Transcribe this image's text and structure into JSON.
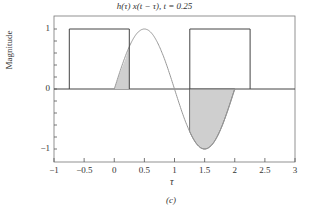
{
  "chart_data": {
    "type": "line",
    "title": "h(τ) x(t − τ), t = 0.25",
    "xlabel": "τ",
    "ylabel": "Magnitude",
    "caption": "(c)",
    "xlim": [
      -1,
      3
    ],
    "ylim": [
      -1.25,
      1.25
    ],
    "xticks": [
      "−1",
      "−0.5",
      "0",
      "0.5",
      "1",
      "1.5",
      "2",
      "2.5",
      "3"
    ],
    "yticks": [
      "1",
      "0",
      "−1"
    ],
    "grid": false,
    "series": [
      {
        "name": "h(τ)",
        "description": "sin(πτ) for 0 ≤ τ ≤ 2, else 0",
        "color": "#999999"
      },
      {
        "name": "x(t − τ)",
        "description": "rectangular pulses of height 1",
        "segments": [
          [
            -0.75,
            0.25
          ],
          [
            1.25,
            2.25
          ]
        ],
        "color": "#444444"
      }
    ],
    "shaded_product": {
      "intervals": [
        [
          0,
          0.25
        ],
        [
          1.25,
          2
        ]
      ],
      "color": "#cccccc"
    }
  }
}
